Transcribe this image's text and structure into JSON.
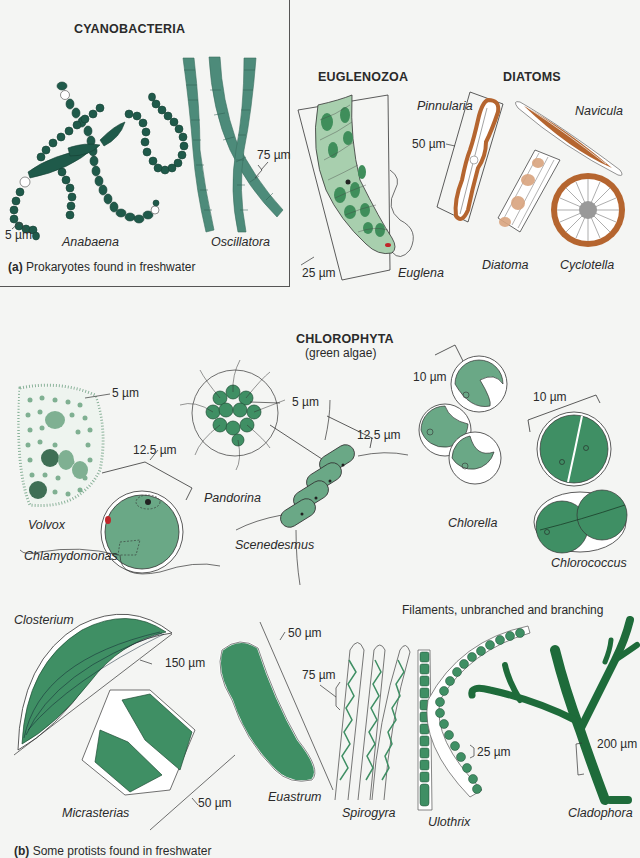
{
  "colors": {
    "cyanobacteria_dark": "#1f5a4a",
    "oscillatoria": "#4d8b7a",
    "euglena": "#a8cfae",
    "euglena_chloroplast": "#3f8e5b",
    "diatom_brown": "#b5652f",
    "diatom_light": "#d9a47e",
    "green_algae": "#3f8f64",
    "green_dark": "#2b7a4b",
    "background": "#f4f5f3",
    "eyespot": "#c0262a"
  },
  "panel_a": {
    "heading": "CYANOBACTERIA",
    "caption_letter": "(a)",
    "caption_text": "Prokaryotes found in freshwater",
    "organisms": [
      {
        "name": "Anabaena",
        "scale": "5 µm"
      },
      {
        "name": "Oscillatora",
        "scale": "75 µm"
      }
    ]
  },
  "euglenozoa": {
    "heading": "EUGLENOZOA",
    "organisms": [
      {
        "name": "Euglena",
        "scale": "25 µm"
      }
    ]
  },
  "diatoms": {
    "heading": "DIATOMS",
    "organisms": [
      {
        "name": "Pinnularia",
        "scale": "50 µm"
      },
      {
        "name": "Navicula"
      },
      {
        "name": "Diatoma"
      },
      {
        "name": "Cyclotella"
      }
    ]
  },
  "chlorophyta": {
    "heading": "CHLOROPHYTA",
    "subheading": "(green algae)",
    "organisms": [
      {
        "name": "Volvox",
        "scale": "5 µm"
      },
      {
        "name": "Chlamydomonas",
        "scale": "12.5 µm"
      },
      {
        "name": "Pandorina",
        "scale": "5 µm"
      },
      {
        "name": "Scenedesmus",
        "scale": "12.5 µm"
      },
      {
        "name": "Chlorella",
        "scale": "10 µm"
      },
      {
        "name": "Chlorococcus",
        "scale": "10 µm"
      }
    ]
  },
  "desmids_filaments": {
    "filaments_heading": "Filaments, unbranched and branching",
    "organisms": [
      {
        "name": "Closterium",
        "scale": "150 µm"
      },
      {
        "name": "Micrasterias",
        "scale": "50 µm"
      },
      {
        "name": "Euastrum",
        "scale": "50 µm"
      },
      {
        "name": "Spirogyra",
        "scale": "75 µm"
      },
      {
        "name": "Ulothrix",
        "scale": "25 µm"
      },
      {
        "name": "Cladophora",
        "scale": "200 µm"
      }
    ]
  },
  "panel_b": {
    "caption_letter": "(b)",
    "caption_text": "Some protists found in freshwater"
  }
}
